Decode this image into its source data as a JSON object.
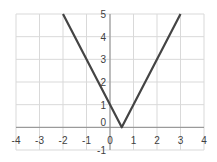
{
  "chart_data": {
    "type": "line",
    "title": "",
    "xlabel": "",
    "ylabel": "",
    "xlim": [
      -4,
      4
    ],
    "ylim": [
      -1,
      5
    ],
    "grid": true,
    "legend": null,
    "x_ticks": [
      "-4",
      "-3",
      "-2",
      "-1",
      "0",
      "1",
      "2",
      "3",
      "4"
    ],
    "y_ticks": [
      "-1",
      "0",
      "1",
      "2",
      "3",
      "4",
      "5"
    ],
    "series": [
      {
        "name": "y = |2x - 1|",
        "x": [
          -2,
          0.5,
          3
        ],
        "y": [
          5,
          0,
          5
        ],
        "color": "#444444"
      }
    ]
  },
  "colors": {
    "grid": "#d9d9d9",
    "axis": "#8c8c8c",
    "line": "#444444",
    "text": "#404040"
  }
}
